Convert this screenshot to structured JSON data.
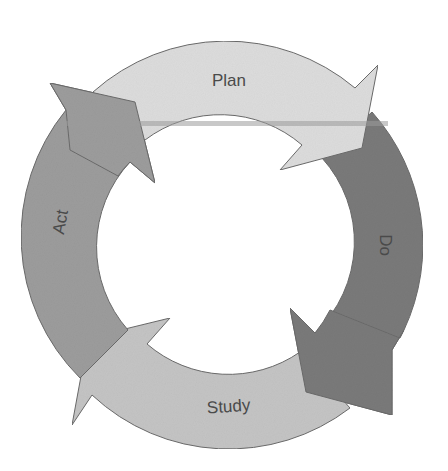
{
  "diagram": {
    "type": "cycle",
    "title": "",
    "segments": [
      {
        "id": "plan",
        "label": "Plan",
        "color": "#dcdcdc",
        "order": 1
      },
      {
        "id": "do",
        "label": "Do",
        "color": "#7a7a7a",
        "order": 2
      },
      {
        "id": "study",
        "label": "Study",
        "color": "#c4c4c4",
        "order": 3
      },
      {
        "id": "act",
        "label": "Act",
        "color": "#9c9c9c",
        "order": 4
      }
    ],
    "flow": [
      "plan",
      "do",
      "study",
      "act",
      "plan"
    ]
  }
}
